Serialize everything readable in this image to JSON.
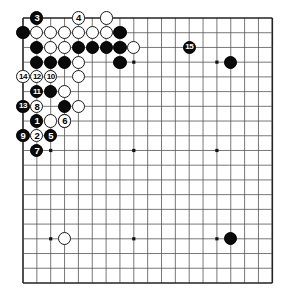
{
  "board": {
    "name": "go-board",
    "cols": 18,
    "rows": 19,
    "origin_x": 23,
    "origin_y": 18,
    "step_x": 13.85,
    "step_y": 14.72,
    "line_color": "#555555",
    "edge_color": "#222222",
    "background": "#ffffff",
    "stone_radius": 6.6,
    "star_points": [
      {
        "c": 2,
        "r": 3
      },
      {
        "c": 8,
        "r": 3
      },
      {
        "c": 14,
        "r": 3
      },
      {
        "c": 2,
        "r": 9
      },
      {
        "c": 8,
        "r": 9
      },
      {
        "c": 14,
        "r": 9
      },
      {
        "c": 2,
        "r": 15
      },
      {
        "c": 8,
        "r": 15
      },
      {
        "c": 14,
        "r": 15
      }
    ]
  },
  "stones": [
    {
      "c": 0,
      "r": 1,
      "color": "black",
      "label": ""
    },
    {
      "c": 1,
      "r": 1,
      "color": "white",
      "label": ""
    },
    {
      "c": 2,
      "r": 1,
      "color": "white",
      "label": ""
    },
    {
      "c": 3,
      "r": 1,
      "color": "white",
      "label": ""
    },
    {
      "c": 4,
      "r": 1,
      "color": "white",
      "label": ""
    },
    {
      "c": 5,
      "r": 1,
      "color": "white",
      "label": ""
    },
    {
      "c": 6,
      "r": 1,
      "color": "white",
      "label": ""
    },
    {
      "c": 7,
      "r": 1,
      "color": "black",
      "label": ""
    },
    {
      "c": 1,
      "r": 2,
      "color": "black",
      "label": ""
    },
    {
      "c": 2,
      "r": 2,
      "color": "white",
      "label": ""
    },
    {
      "c": 3,
      "r": 2,
      "color": "white",
      "label": ""
    },
    {
      "c": 4,
      "r": 2,
      "color": "black",
      "label": ""
    },
    {
      "c": 5,
      "r": 2,
      "color": "black",
      "label": ""
    },
    {
      "c": 6,
      "r": 2,
      "color": "black",
      "label": ""
    },
    {
      "c": 7,
      "r": 2,
      "color": "black",
      "label": ""
    },
    {
      "c": 8,
      "r": 2,
      "color": "white",
      "label": ""
    },
    {
      "c": 1,
      "r": 3,
      "color": "black",
      "label": ""
    },
    {
      "c": 2,
      "r": 3,
      "color": "black",
      "label": ""
    },
    {
      "c": 3,
      "r": 3,
      "color": "black",
      "label": ""
    },
    {
      "c": 4,
      "r": 3,
      "color": "white",
      "label": ""
    },
    {
      "c": 7,
      "r": 3,
      "color": "black",
      "label": ""
    },
    {
      "c": 4,
      "r": 4,
      "color": "white",
      "label": ""
    },
    {
      "c": 2,
      "r": 5,
      "color": "black",
      "label": ""
    },
    {
      "c": 3,
      "r": 5,
      "color": "white",
      "label": ""
    },
    {
      "c": 3,
      "r": 6,
      "color": "black",
      "label": ""
    },
    {
      "c": 4,
      "r": 6,
      "color": "white",
      "label": ""
    },
    {
      "c": 2,
      "r": 7,
      "color": "white",
      "label": ""
    },
    {
      "c": 3,
      "r": 7,
      "color": "white",
      "label": ""
    },
    {
      "c": 1,
      "r": 0,
      "color": "black",
      "label": "3"
    },
    {
      "c": 4,
      "r": 0,
      "color": "white",
      "label": "4"
    },
    {
      "c": 6,
      "r": 0,
      "color": "white",
      "label": ""
    },
    {
      "c": 0,
      "r": 4,
      "color": "white",
      "label": "14"
    },
    {
      "c": 1,
      "r": 4,
      "color": "white",
      "label": "12"
    },
    {
      "c": 2,
      "r": 4,
      "color": "white",
      "label": "10"
    },
    {
      "c": 1,
      "r": 5,
      "color": "black",
      "label": "11"
    },
    {
      "c": 0,
      "r": 6,
      "color": "black",
      "label": "13"
    },
    {
      "c": 1,
      "r": 6,
      "color": "white",
      "label": "8"
    },
    {
      "c": 1,
      "r": 7,
      "color": "black",
      "label": "1"
    },
    {
      "c": 3,
      "r": 7,
      "color": "white",
      "label": "6"
    },
    {
      "c": 0,
      "r": 8,
      "color": "black",
      "label": "9"
    },
    {
      "c": 1,
      "r": 8,
      "color": "white",
      "label": "2"
    },
    {
      "c": 2,
      "r": 8,
      "color": "black",
      "label": "5"
    },
    {
      "c": 1,
      "r": 9,
      "color": "black",
      "label": "7"
    },
    {
      "c": 12,
      "r": 2,
      "color": "black",
      "label": "15"
    },
    {
      "c": 15,
      "r": 3,
      "color": "black",
      "label": ""
    },
    {
      "c": 3,
      "r": 15,
      "color": "white",
      "label": ""
    },
    {
      "c": 15,
      "r": 15,
      "color": "black",
      "label": ""
    }
  ]
}
